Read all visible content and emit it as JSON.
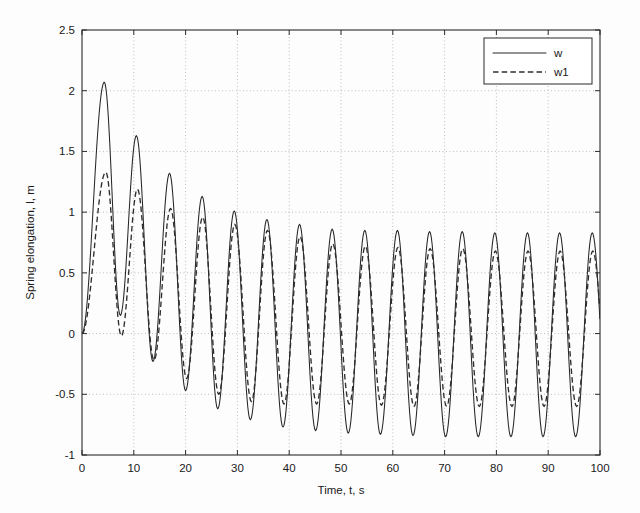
{
  "chart_data": {
    "type": "line",
    "title": "",
    "xlabel": "Time, t, s",
    "ylabel": "Spring elongation, l, m",
    "xlim": [
      0,
      100
    ],
    "ylim": [
      -1,
      2.5
    ],
    "xticks": [
      0,
      10,
      20,
      30,
      40,
      50,
      60,
      70,
      80,
      90,
      100
    ],
    "yticks": [
      -1,
      -0.5,
      0,
      0.5,
      1,
      1.5,
      2,
      2.5
    ],
    "xtick_labels": [
      "0",
      "10",
      "20",
      "30",
      "40",
      "50",
      "60",
      "70",
      "80",
      "90",
      "100"
    ],
    "ytick_labels": [
      "-1",
      "-0.5",
      "0",
      "0.5",
      "1",
      "1.5",
      "2",
      "2.5"
    ],
    "grid": true,
    "grid_style": "dotted",
    "legend_position": "top-right",
    "series": [
      {
        "name": "w",
        "style": "solid",
        "color": "#262626",
        "period": 6.52,
        "description": "Damped forced oscillation settling to steady-state amplitude about 0.84",
        "peaks": [
          {
            "t": 4.3,
            "value": 2.07
          },
          {
            "t": 10.5,
            "value": 1.63
          },
          {
            "t": 16.9,
            "value": 1.32
          },
          {
            "t": 23.2,
            "value": 1.13
          },
          {
            "t": 29.4,
            "value": 1.01
          },
          {
            "t": 35.7,
            "value": 0.94
          },
          {
            "t": 42.0,
            "value": 0.9
          },
          {
            "t": 48.3,
            "value": 0.86
          },
          {
            "t": 54.6,
            "value": 0.85
          },
          {
            "t": 60.9,
            "value": 0.85
          },
          {
            "t": 67.1,
            "value": 0.84
          },
          {
            "t": 73.4,
            "value": 0.84
          },
          {
            "t": 79.7,
            "value": 0.83
          },
          {
            "t": 86.0,
            "value": 0.83
          },
          {
            "t": 92.2,
            "value": 0.83
          },
          {
            "t": 98.5,
            "value": 0.83
          }
        ],
        "troughs": [
          {
            "t": 7.4,
            "value": 0.15
          },
          {
            "t": 13.7,
            "value": -0.23
          },
          {
            "t": 20.0,
            "value": -0.47
          },
          {
            "t": 26.2,
            "value": -0.62
          },
          {
            "t": 32.5,
            "value": -0.71
          },
          {
            "t": 38.8,
            "value": -0.77
          },
          {
            "t": 45.1,
            "value": -0.8
          },
          {
            "t": 51.4,
            "value": -0.82
          },
          {
            "t": 57.6,
            "value": -0.83
          },
          {
            "t": 63.9,
            "value": -0.84
          },
          {
            "t": 70.2,
            "value": -0.85
          },
          {
            "t": 76.5,
            "value": -0.85
          },
          {
            "t": 82.8,
            "value": -0.85
          },
          {
            "t": 89.0,
            "value": -0.85
          },
          {
            "t": 95.3,
            "value": -0.85
          }
        ]
      },
      {
        "name": "w1",
        "style": "dashed",
        "color": "#2e2e2e",
        "period": 6.52,
        "description": "Linearized/approximate response, smaller initial peaks, converges to w after about 25 s",
        "peaks": [
          {
            "t": 4.6,
            "value": 1.33
          },
          {
            "t": 10.7,
            "value": 1.19
          },
          {
            "t": 17.1,
            "value": 1.03
          },
          {
            "t": 23.3,
            "value": 0.96
          },
          {
            "t": 29.5,
            "value": 0.9
          },
          {
            "t": 35.8,
            "value": 0.85
          },
          {
            "t": 42.1,
            "value": 0.8
          },
          {
            "t": 48.4,
            "value": 0.74
          },
          {
            "t": 54.7,
            "value": 0.72
          },
          {
            "t": 61.0,
            "value": 0.71
          },
          {
            "t": 67.2,
            "value": 0.7
          },
          {
            "t": 73.5,
            "value": 0.7
          },
          {
            "t": 79.8,
            "value": 0.68
          },
          {
            "t": 86.1,
            "value": 0.68
          },
          {
            "t": 92.3,
            "value": 0.68
          },
          {
            "t": 98.6,
            "value": 0.68
          }
        ],
        "troughs": [
          {
            "t": 7.6,
            "value": -0.02
          },
          {
            "t": 13.9,
            "value": -0.22
          },
          {
            "t": 20.2,
            "value": -0.37
          },
          {
            "t": 26.4,
            "value": -0.5
          },
          {
            "t": 32.7,
            "value": -0.56
          },
          {
            "t": 39.0,
            "value": -0.58
          },
          {
            "t": 45.3,
            "value": -0.58
          },
          {
            "t": 51.6,
            "value": -0.58
          },
          {
            "t": 57.8,
            "value": -0.59
          },
          {
            "t": 64.1,
            "value": -0.6
          },
          {
            "t": 70.4,
            "value": -0.6
          },
          {
            "t": 76.7,
            "value": -0.6
          },
          {
            "t": 83.0,
            "value": -0.6
          },
          {
            "t": 89.2,
            "value": -0.6
          },
          {
            "t": 95.5,
            "value": -0.6
          }
        ]
      }
    ],
    "legend": [
      {
        "label": "w",
        "style": "solid"
      },
      {
        "label": "w1",
        "style": "dashed"
      }
    ]
  }
}
